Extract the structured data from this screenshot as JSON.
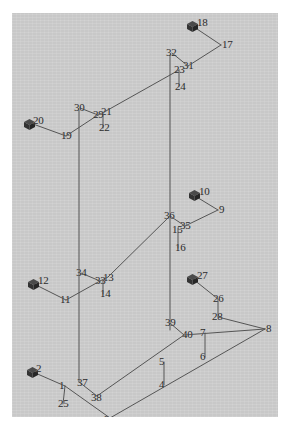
{
  "figure": {
    "background_color": "#cccccc",
    "page_color": "#ffffff",
    "line_color": "#555555",
    "label_color": "#2b2b2b",
    "device_color": "#3a3a3a",
    "panel": {
      "x": 12,
      "y": 13,
      "width": 266,
      "height": 404
    }
  },
  "devices": [
    {
      "id": "18",
      "label": "18",
      "x": 186,
      "y": 19,
      "label_x": 197,
      "label_y": 15
    },
    {
      "id": "20",
      "label": "20",
      "x": 23,
      "y": 117,
      "label_x": 33,
      "label_y": 113
    },
    {
      "id": "10",
      "label": "10",
      "x": 188,
      "y": 188,
      "label_x": 199,
      "label_y": 184
    },
    {
      "id": "12",
      "label": "12",
      "x": 27,
      "y": 277,
      "label_x": 38,
      "label_y": 273
    },
    {
      "id": "27",
      "label": "27",
      "x": 186,
      "y": 272,
      "label_x": 197,
      "label_y": 268
    },
    {
      "id": "2",
      "label": "2",
      "x": 26,
      "y": 365,
      "label_x": 36,
      "label_y": 361
    }
  ],
  "nodes": [
    {
      "label": "1",
      "x": 59,
      "y": 378
    },
    {
      "label": "2",
      "x": 36,
      "y": 361
    },
    {
      "label": "3",
      "x": 104,
      "y": 412
    },
    {
      "label": "4",
      "x": 159,
      "y": 377
    },
    {
      "label": "5",
      "x": 159,
      "y": 354
    },
    {
      "label": "6",
      "x": 200,
      "y": 349
    },
    {
      "label": "7",
      "x": 200,
      "y": 325
    },
    {
      "label": "8",
      "x": 259,
      "y": 321
    },
    {
      "label": "9",
      "x": 213,
      "y": 202
    },
    {
      "label": "10",
      "x": 199,
      "y": 184
    },
    {
      "label": "11",
      "x": 60,
      "y": 292
    },
    {
      "label": "12",
      "x": 38,
      "y": 273
    },
    {
      "label": "13",
      "x": 103,
      "y": 270
    },
    {
      "label": "14",
      "x": 100,
      "y": 286
    },
    {
      "label": "15",
      "x": 172,
      "y": 222
    },
    {
      "label": "16",
      "x": 175,
      "y": 240
    },
    {
      "label": "17",
      "x": 216,
      "y": 37
    },
    {
      "label": "18",
      "x": 197,
      "y": 15
    },
    {
      "label": "19",
      "x": 61,
      "y": 128
    },
    {
      "label": "20",
      "x": 33,
      "y": 113
    },
    {
      "label": "21",
      "x": 101,
      "y": 104
    },
    {
      "label": "22",
      "x": 99,
      "y": 120
    },
    {
      "label": "23",
      "x": 174,
      "y": 62
    },
    {
      "label": "24",
      "x": 175,
      "y": 79
    },
    {
      "label": "25",
      "x": 58,
      "y": 396
    },
    {
      "label": "26",
      "x": 213,
      "y": 291
    },
    {
      "label": "27",
      "x": 197,
      "y": 268
    },
    {
      "label": "28",
      "x": 212,
      "y": 309
    },
    {
      "label": "29",
      "x": 93,
      "y": 107
    },
    {
      "label": "30",
      "x": 74,
      "y": 100
    },
    {
      "label": "31",
      "x": 183,
      "y": 58
    },
    {
      "label": "32",
      "x": 166,
      "y": 45
    },
    {
      "label": "33",
      "x": 95,
      "y": 273
    },
    {
      "label": "34",
      "x": 76,
      "y": 265
    },
    {
      "label": "35",
      "x": 180,
      "y": 218
    },
    {
      "label": "36",
      "x": 164,
      "y": 208
    },
    {
      "label": "37",
      "x": 77,
      "y": 375
    },
    {
      "label": "38",
      "x": 91,
      "y": 390
    },
    {
      "label": "39",
      "x": 165,
      "y": 315
    },
    {
      "label": "40",
      "x": 182,
      "y": 327
    }
  ],
  "edges": [
    {
      "from": "2-cube",
      "to": "1",
      "points": "33,372 65,386"
    },
    {
      "from": "1",
      "to": "25",
      "points": "65,386 63,404"
    },
    {
      "from": "1",
      "to": "3",
      "points": "65,386 110,418"
    },
    {
      "from": "37",
      "to": "38",
      "points": "77,384 97,396"
    },
    {
      "from": "3",
      "to": "8",
      "points": "110,418 265,329"
    },
    {
      "from": "38",
      "to": "40",
      "points": "97,396 184,335"
    },
    {
      "from": "4",
      "to": "5",
      "points": "164,385 164,362"
    },
    {
      "from": "6",
      "to": "7",
      "points": "205,357 205,333"
    },
    {
      "from": "40",
      "to": "8",
      "points": "184,335 265,329"
    },
    {
      "from": "39",
      "to": "40",
      "points": "170,323 184,335"
    },
    {
      "from": "27",
      "to": "26",
      "points": "193,279 218,299"
    },
    {
      "from": "26",
      "to": "28",
      "points": "218,299 218,317"
    },
    {
      "from": "28",
      "to": "8",
      "points": "218,317 265,329"
    },
    {
      "from": "12",
      "to": "11",
      "points": "34,284 66,300"
    },
    {
      "from": "11",
      "to": "33",
      "points": "66,300 100,281"
    },
    {
      "from": "34",
      "to": "33",
      "points": "81,273 100,281"
    },
    {
      "from": "33",
      "to": "13",
      "points": "100,281 108,277"
    },
    {
      "from": "33",
      "to": "14",
      "points": "103,281 103,294"
    },
    {
      "from": "13",
      "to": "36",
      "points": "108,277 170,216"
    },
    {
      "from": "10",
      "to": "9",
      "points": "195,196 218,210"
    },
    {
      "from": "9",
      "to": "35",
      "points": "218,210 185,226"
    },
    {
      "from": "36",
      "to": "35",
      "points": "170,216 185,226"
    },
    {
      "from": "15",
      "to": "16",
      "points": "178,228 178,248"
    },
    {
      "from": "20",
      "to": "19",
      "points": "33,124 66,136"
    },
    {
      "from": "19",
      "to": "29",
      "points": "66,136 98,115"
    },
    {
      "from": "30",
      "to": "29",
      "points": "80,108 98,115"
    },
    {
      "from": "29",
      "to": "21",
      "points": "98,115 106,111"
    },
    {
      "from": "29",
      "to": "22",
      "points": "103,115 103,128"
    },
    {
      "from": "21",
      "to": "23",
      "points": "106,111 179,70"
    },
    {
      "from": "18",
      "to": "17",
      "points": "194,27 221,45"
    },
    {
      "from": "17",
      "to": "31",
      "points": "221,45 188,66"
    },
    {
      "from": "32",
      "to": "23",
      "points": "172,53 188,66"
    },
    {
      "from": "23",
      "to": "24",
      "points": "179,70 179,86"
    },
    {
      "from": "left-column",
      "to": "",
      "points": "79,110 79,382"
    },
    {
      "from": "right-column",
      "to": "",
      "points": "170,55 170,330"
    }
  ],
  "counts": {
    "device_count": 6,
    "node_label_count": 40
  }
}
